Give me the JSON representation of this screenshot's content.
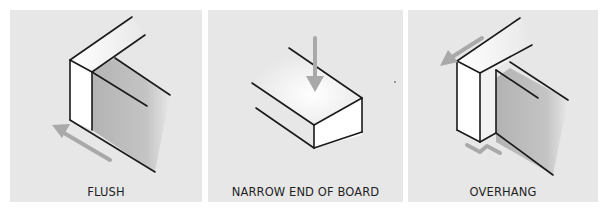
{
  "figure": {
    "panels": [
      {
        "id": "flush",
        "label": "FLUSH",
        "icon": "flush-board-icon"
      },
      {
        "id": "narrow-end",
        "label": "NARROW END OF BOARD",
        "icon": "narrow-end-board-icon"
      },
      {
        "id": "overhang",
        "label": "OVERHANG",
        "icon": "overhang-board-icon"
      }
    ],
    "colors": {
      "panel_background": "#e7e7e7",
      "line": "#1a1a1a",
      "arrow": "#a9a9a9",
      "board_face": "#ffffff",
      "shadow": "#b5b5b5"
    }
  }
}
